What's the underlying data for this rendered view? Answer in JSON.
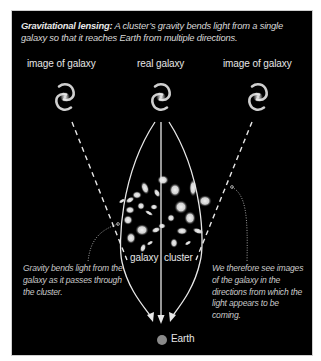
{
  "caption": {
    "title": "Gravitational lensing:",
    "text": " A cluster’s gravity bends light from a single galaxy so that it reaches Earth from multiple directions."
  },
  "labels": {
    "left_image": "image of galaxy",
    "real": "real galaxy",
    "right_image": "image of galaxy",
    "cluster_left": "galaxy",
    "cluster_right": "cluster",
    "earth": "Earth"
  },
  "notes": {
    "left": "Gravity bends light from the galaxy as it passes through the cluster.",
    "right": "We therefore see images of the galaxy in the directions from which the light appears to be coming."
  },
  "colors": {
    "background": "#000000",
    "line": "#e8e8e8",
    "earth": "#8a8a8a"
  }
}
